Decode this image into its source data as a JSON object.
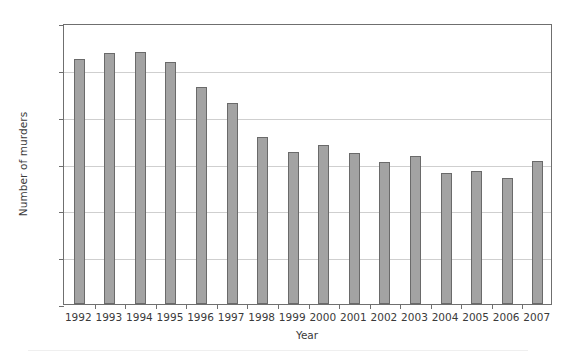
{
  "chart_data": {
    "type": "bar",
    "title": "",
    "xlabel": "Year",
    "ylabel": "Number of murders",
    "categories": [
      "1992",
      "1993",
      "1994",
      "1995",
      "1996",
      "1997",
      "1998",
      "1999",
      "2000",
      "2001",
      "2002",
      "2003",
      "2004",
      "2005",
      "2006",
      "2007"
    ],
    "values": [
      1045,
      1072,
      1077,
      1035,
      925,
      858,
      715,
      650,
      678,
      645,
      608,
      630,
      560,
      568,
      537,
      610
    ],
    "ylim": [
      0,
      1200
    ],
    "ytick_labels": [
      "0",
      "200",
      "400",
      "600",
      "800",
      "1000",
      "1200"
    ],
    "ytick_values": [
      0,
      200,
      400,
      600,
      800,
      1000,
      1200
    ],
    "grid": "horizontal",
    "legend": "none",
    "series": [
      {
        "name": "Number of murders",
        "values": [
          1045,
          1072,
          1077,
          1035,
          925,
          858,
          715,
          650,
          678,
          645,
          608,
          630,
          560,
          568,
          537,
          610
        ]
      }
    ],
    "colors": {
      "bar_fill": "#a3a3a3",
      "bar_border": "#6a6a6a",
      "gridline": "#cfcfcf",
      "axis": "#6f6f6f",
      "text": "#3a3a3a",
      "background": "#ffffff"
    }
  }
}
